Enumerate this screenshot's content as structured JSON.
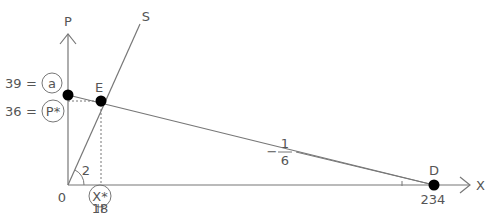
{
  "diagram": {
    "axes": {
      "y_label": "P",
      "x_label": "X",
      "origin_label": "0"
    },
    "supply_line_label": "S",
    "points": {
      "a": {
        "label": "a",
        "value_label": "39",
        "equals": "="
      },
      "E": {
        "label": "E"
      },
      "P_star": {
        "label": "P*",
        "value_label": "36",
        "equals": "="
      },
      "X_star": {
        "label": "X*",
        "value_label": "18",
        "equals": "||"
      },
      "D": {
        "label": "D",
        "value_label": "234"
      }
    },
    "slope_S": {
      "label": "2"
    },
    "slope_D": {
      "sign": "−",
      "numerator": "1",
      "denominator": "6"
    },
    "colors": {
      "line": "#777777",
      "text": "#555555",
      "point": "#000000"
    }
  }
}
